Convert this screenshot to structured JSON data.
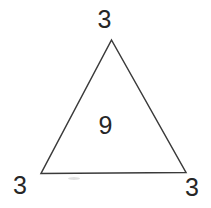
{
  "figure": {
    "kind": "geometry-diagram",
    "shape": "triangle",
    "background_color": "#ffffff",
    "stroke_color": "#3a3a3a",
    "stroke_width": 1.5,
    "text_color": "#262626",
    "interior_value": "9",
    "vertex_labels": {
      "top": "3",
      "bottom_left": "3",
      "bottom_right": "3"
    },
    "geometry": {
      "apex": [
        111.5,
        40
      ],
      "bottom_left": [
        41,
        173.5
      ],
      "bottom_right": [
        186,
        172.5
      ]
    },
    "artifacts": {
      "smudge_note": ""
    }
  },
  "chart_data": {
    "type": "diagram",
    "title": "",
    "shape": "triangle",
    "labels": [
      {
        "position": "top-vertex",
        "value": "3"
      },
      {
        "position": "bottom-left-vertex",
        "value": "3"
      },
      {
        "position": "bottom-right-vertex",
        "value": "3"
      },
      {
        "position": "interior-center",
        "value": "9"
      }
    ]
  }
}
